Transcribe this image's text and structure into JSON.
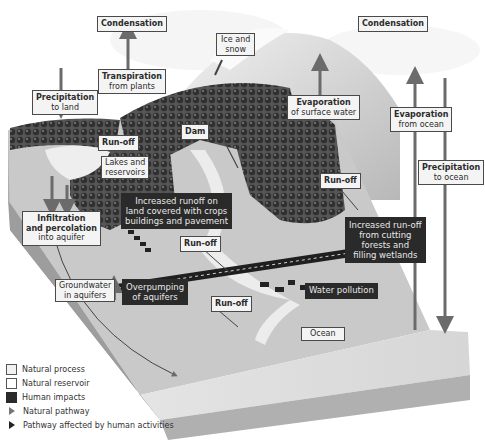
{
  "diagram": {
    "labels": {
      "condensation_left": {
        "title": "Condensation"
      },
      "condensation_right": {
        "title": "Condensation"
      },
      "ice_snow": {
        "line1": "Ice and",
        "line2": "snow"
      },
      "transpiration": {
        "title": "Transpiration",
        "sub": "from plants"
      },
      "precip_land": {
        "title": "Precipitation",
        "sub": "to land"
      },
      "evap_surface": {
        "title": "Evaporation",
        "sub": "of surface water"
      },
      "evap_ocean": {
        "title": "Evaporation",
        "sub": "from ocean"
      },
      "precip_ocean": {
        "title": "Precipitation",
        "sub": "to ocean"
      },
      "runoff_top": {
        "title": "Run-off"
      },
      "dam": {
        "title": "Dam"
      },
      "lakes": {
        "line1": "Lakes and",
        "line2": "reservoirs"
      },
      "runoff_right": {
        "title": "Run-off"
      },
      "increased_runoff_land": {
        "line1": "Increased runoff on",
        "line2": "land covered with crops",
        "line3": "buildings and pavement"
      },
      "infiltration": {
        "title1": "Infiltration",
        "title2": "and percolation",
        "sub": "into aquifer"
      },
      "runoff_mid": {
        "title": "Run-off"
      },
      "increased_runoff_forest": {
        "line1": "Increased run-off",
        "line2": "from cutting",
        "line3": "forests and",
        "line4": "filling wetlands"
      },
      "groundwater": {
        "line1": "Groundwater",
        "line2": "in aquifers"
      },
      "overpumping": {
        "line1": "Overpumping",
        "line2": "of aquifers"
      },
      "runoff_bottom": {
        "title": "Run-off"
      },
      "water_pollution": {
        "title": "Water pollution"
      },
      "ocean": {
        "title": "Ocean"
      }
    },
    "legend": [
      {
        "label": "Natural process",
        "type": "box-light"
      },
      {
        "label": "Natural reservoir",
        "type": "box-white"
      },
      {
        "label": "Human impacts",
        "type": "box-dark"
      },
      {
        "label": "Natural pathway",
        "type": "arrow-gray"
      },
      {
        "label": "Pathway affected by human activities",
        "type": "arrow-dark"
      }
    ],
    "colors": {
      "human_box": "#2a2a2a",
      "natural_box": "#f4f4f4",
      "arrow": "#6b6b6b",
      "forest": "#3d3d3d",
      "terrain": "#bdbdbd"
    }
  }
}
